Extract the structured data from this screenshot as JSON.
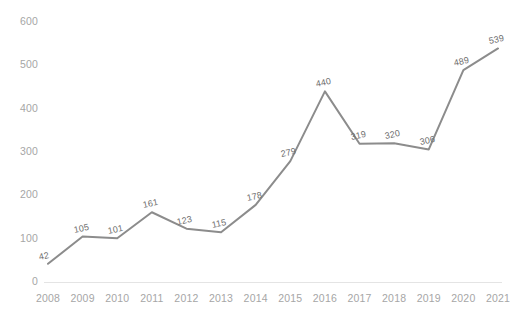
{
  "chart_data": {
    "type": "line",
    "title": "",
    "subtitle": "",
    "xlabel": "",
    "ylabel": "",
    "categories": [
      "2008",
      "2009",
      "2010",
      "2011",
      "2012",
      "2013",
      "2014",
      "2015",
      "2016",
      "2017",
      "2018",
      "2019",
      "2020",
      "2021"
    ],
    "values": [
      42,
      105,
      101,
      161,
      123,
      115,
      178,
      279,
      440,
      319,
      320,
      306,
      489,
      539
    ],
    "point_labels": [
      "42",
      "105",
      "101",
      "161",
      "123",
      "115",
      "178",
      "279",
      "440",
      "319",
      "320",
      "306",
      "489",
      "539"
    ],
    "series": [
      {
        "name": "",
        "values": [
          42,
          105,
          101,
          161,
          123,
          115,
          178,
          279,
          440,
          319,
          320,
          306,
          489,
          539
        ]
      }
    ],
    "ylim": [
      0,
      600
    ],
    "xlim": [
      0,
      13
    ],
    "y_ticks": [
      "0",
      "100",
      "200",
      "300",
      "400",
      "500",
      "600"
    ],
    "y_tick_values": [
      0,
      100,
      200,
      300,
      400,
      500,
      600
    ],
    "grid": false,
    "legend": false,
    "legend_position": "none",
    "line_color": "#8c8c8c",
    "label_color": "#6f6f6f",
    "tick_color": "#a6a6a6",
    "axis_color": "#e4e4e4",
    "background_color": "#ffffff",
    "data_labels_shown": true,
    "markers_shown": false
  }
}
